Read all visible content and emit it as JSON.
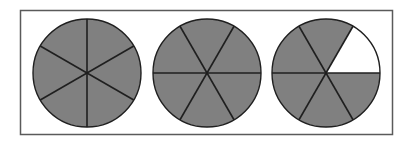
{
  "figure": {
    "canvas": {
      "width": 413,
      "height": 143,
      "background": "#ffffff"
    }
  },
  "frame": {
    "name": "outer-frame",
    "x": 20.5,
    "y": 10.5,
    "width": 372,
    "height": 124,
    "stroke": "#5a5a5a",
    "stroke_width": 1.5,
    "fill": "none"
  },
  "style": {
    "shaded_fill": "#808080",
    "unshaded_fill": "#ffffff",
    "outline_stroke": "#1f1f1f",
    "outline_width": 1.4,
    "divider_stroke": "#1f1f1f",
    "divider_width": 1.6
  },
  "chart_data": {
    "type": "pie",
    "xlabel": "",
    "ylabel": "",
    "legend": [],
    "grid": false,
    "sectors_per_circle": 6,
    "sector_angle_degrees": 60,
    "total_shaded_sectors": 17,
    "total_sectors": 18,
    "circles": [
      {
        "name": "circle-1",
        "label": "1",
        "cx": 87,
        "cy": 73,
        "r": 54,
        "rotation_degrees": 30,
        "shaded_count": 6,
        "total_count": 6,
        "fraction": "6/6",
        "value": 1.0,
        "categories": [
          "s1",
          "s2",
          "s3",
          "s4",
          "s5",
          "s6"
        ],
        "values": [
          1,
          1,
          1,
          1,
          1,
          1
        ],
        "shaded": [
          true,
          true,
          true,
          true,
          true,
          true
        ]
      },
      {
        "name": "circle-2",
        "label": "2",
        "cx": 207,
        "cy": 73,
        "r": 54,
        "rotation_degrees": 0,
        "shaded_count": 6,
        "total_count": 6,
        "fraction": "6/6",
        "value": 1.0,
        "categories": [
          "s1",
          "s2",
          "s3",
          "s4",
          "s5",
          "s6"
        ],
        "values": [
          1,
          1,
          1,
          1,
          1,
          1
        ],
        "shaded": [
          true,
          true,
          true,
          true,
          true,
          true
        ]
      },
      {
        "name": "circle-3",
        "label": "3",
        "cx": 326,
        "cy": 73,
        "r": 54,
        "rotation_degrees": 0,
        "shaded_count": 5,
        "total_count": 6,
        "fraction": "5/6",
        "value": 0.8333,
        "categories": [
          "s1",
          "s2",
          "s3",
          "s4",
          "s5",
          "s6"
        ],
        "values": [
          1,
          1,
          1,
          1,
          1,
          1
        ],
        "shaded": [
          false,
          true,
          true,
          true,
          true,
          true
        ],
        "unshaded_sector_index": 0,
        "unshaded_sector_position": "upper-right"
      }
    ]
  }
}
